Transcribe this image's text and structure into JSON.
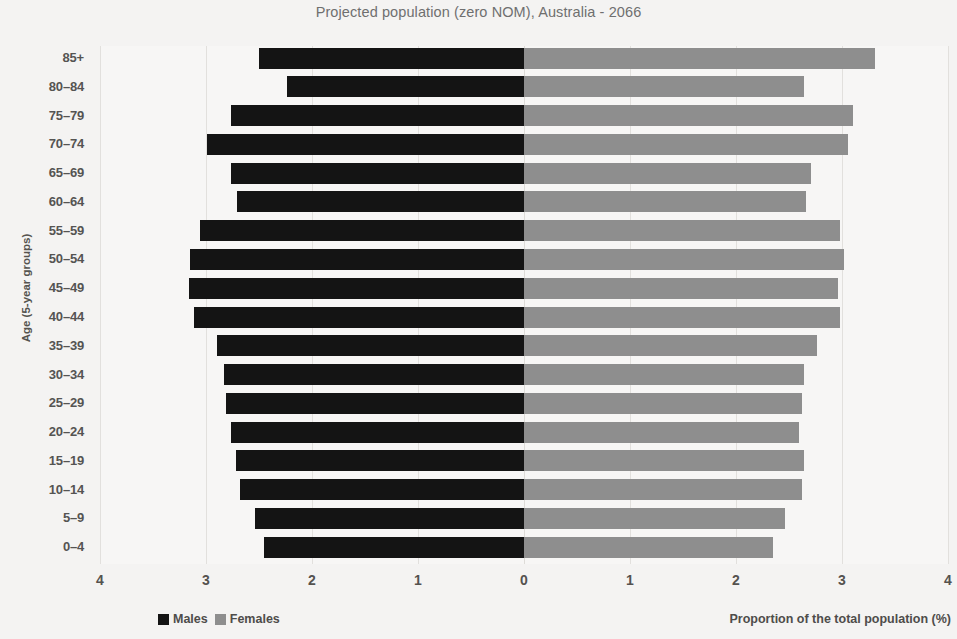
{
  "chart_data": {
    "type": "bar",
    "subtype": "population-pyramid",
    "title": "Projected population (zero NOM), Australia - 2066",
    "xlabel": "Proportion of the total population (%)",
    "ylabel": "Age (5-year groups)",
    "xlim": [
      -4,
      4
    ],
    "xticks": [
      4,
      3,
      2,
      1,
      0,
      1,
      2,
      3,
      4
    ],
    "grid": true,
    "legend_position": "bottom-left",
    "categories": [
      "85+",
      "80–84",
      "75–79",
      "70–74",
      "65–69",
      "60–64",
      "55–59",
      "50–54",
      "45–49",
      "40–44",
      "35–39",
      "30–34",
      "25–29",
      "20–24",
      "15–19",
      "10–14",
      "5–9",
      "0–4"
    ],
    "series": [
      {
        "name": "Males",
        "color": "#141414",
        "direction": "left",
        "values": [
          2.5,
          2.24,
          2.76,
          2.99,
          2.76,
          2.71,
          3.06,
          3.15,
          3.16,
          3.11,
          2.9,
          2.83,
          2.81,
          2.76,
          2.72,
          2.68,
          2.54,
          2.45
        ]
      },
      {
        "name": "Females",
        "color": "#8e8e8e",
        "direction": "right",
        "values": [
          3.31,
          2.64,
          3.1,
          3.06,
          2.71,
          2.66,
          2.98,
          3.02,
          2.96,
          2.98,
          2.76,
          2.64,
          2.62,
          2.59,
          2.64,
          2.62,
          2.46,
          2.35
        ]
      }
    ]
  },
  "legend": {
    "items": [
      {
        "label": "Males",
        "swatch_class": "swatch-male"
      },
      {
        "label": "Females",
        "swatch_class": "swatch-female"
      }
    ]
  }
}
